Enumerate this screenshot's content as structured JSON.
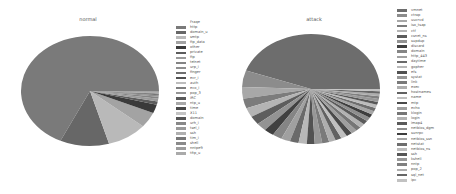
{
  "chart_data": [
    {
      "type": "pie",
      "title": "normal",
      "legend_title": "Fraqe",
      "legend_position": "right",
      "start_angle": 0,
      "direction": "counterclockwise",
      "categories": [
        "http",
        "domain_u",
        "smtp",
        "ftp_data",
        "other",
        "private",
        "ftp",
        "telnet",
        "urp_i",
        "finger",
        "ecr_i",
        "auth",
        "eco_i",
        "pop_3",
        "IRC",
        "ntp_u",
        "time",
        "X11",
        "domain",
        "urh_i",
        "tsel_i",
        "ssh",
        "tim_i",
        "shell",
        "nntpe9",
        "tftp_u"
      ],
      "values": [
        68.0,
        11.5,
        9.5,
        4.5,
        2.5,
        1.0,
        0.8,
        0.6,
        0.4,
        0.3,
        0.2,
        0.15,
        0.1,
        0.1,
        0.05,
        0.05,
        0.05,
        0.05,
        0.04,
        0.03,
        0.03,
        0.03,
        0.02,
        0.02,
        0.02,
        0.01
      ],
      "colors": [
        "#7a7a7a",
        "#676767",
        "#b9b9b9",
        "#a3a3a3",
        "#3a3a3a",
        "#5c5c5c",
        "#9a9a9a",
        "#848484",
        "#8f8f8f",
        "#6f6f6f",
        "#505050",
        "#bdbdbd",
        "#7f7f7f",
        "#959595",
        "#5a5a5a",
        "#a9a9a9",
        "#484848",
        "#c4c4c4",
        "#555555",
        "#888888",
        "#999999",
        "#b0b0b0",
        "#777777",
        "#8a8a8a",
        "#9c9c9c",
        "#aaaaaa"
      ]
    },
    {
      "type": "pie",
      "title": "attack",
      "legend_title": "",
      "legend_position": "right",
      "start_angle": 0,
      "direction": "counterclockwise",
      "categories": [
        "vmnet",
        "ctrap",
        "uucrvd",
        "iso_tsap",
        "ctf",
        "csnet_ns",
        "supdup",
        "discard",
        "domain",
        "http_443",
        "daytime",
        "gopher",
        "efs",
        "systat",
        "link",
        "exec",
        "hostnames",
        "name",
        "mtp",
        "echo",
        "klogin",
        "login",
        "imap4",
        "netbios_dgm",
        "sunrpc",
        "netbios_ssn",
        "netstat",
        "netbios_ns",
        "ssh",
        "kshell",
        "nntp",
        "pop_2",
        "sql_net",
        "ipc"
      ],
      "values": [
        46.0,
        5.0,
        3.5,
        3.0,
        2.8,
        2.6,
        2.5,
        2.4,
        2.3,
        2.2,
        2.1,
        2.0,
        1.9,
        1.8,
        1.7,
        1.6,
        1.5,
        1.5,
        1.4,
        1.4,
        1.3,
        1.3,
        1.2,
        1.2,
        1.1,
        1.1,
        1.0,
        1.0,
        0.9,
        0.9,
        0.8,
        0.8,
        0.7,
        0.7
      ],
      "colors": [
        "#6d6d6d",
        "#8c8c8c",
        "#a8a8a8",
        "#7c7c7c",
        "#b4b4b4",
        "#5d5d5d",
        "#939393",
        "#404040",
        "#858585",
        "#a0a0a0",
        "#6a6a6a",
        "#b8b8b8",
        "#525252",
        "#979797",
        "#7a7a7a",
        "#aeaeae",
        "#626262",
        "#c0c0c0",
        "#4a4a4a",
        "#9f9f9f",
        "#767676",
        "#b2b2b2",
        "#5a5a5a",
        "#8e8e8e",
        "#3e3e3e",
        "#a5a5a5",
        "#6e6e6e",
        "#bcbcbc",
        "#575757",
        "#989898",
        "#808080",
        "#adadad",
        "#676767",
        "#c2c2c2"
      ]
    }
  ],
  "panels": {
    "normal": {
      "title": "normal"
    },
    "attack": {
      "title": "attack"
    }
  }
}
